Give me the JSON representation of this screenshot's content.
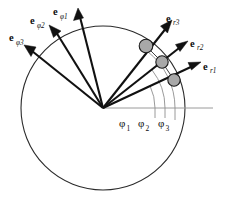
{
  "figure": {
    "background_color": "#ffffff",
    "width": 228,
    "height": 201,
    "circle": {
      "name": "reference-circle",
      "center_x": 103,
      "center_y": 108,
      "radius": 82,
      "stroke_color": "#2b2b2b"
    },
    "origin": {
      "x": 103,
      "y": 108
    },
    "axis": {
      "name": "polar-axis",
      "label": "",
      "from_x": 103,
      "from_y": 108,
      "to_x": 213,
      "to_y": 108,
      "color": "#9a9a9a"
    }
  },
  "angles": {
    "color": "#8f8f8f",
    "items": [
      {
        "id": "phi1",
        "symbol": "φ",
        "subscript": "1",
        "value_deg": 25,
        "arc_radius": 52,
        "label_x": 121,
        "label_y": 126
      },
      {
        "id": "phi2",
        "symbol": "φ",
        "subscript": "2",
        "value_deg": 38,
        "arc_radius": 62,
        "label_x": 140,
        "label_y": 126
      },
      {
        "id": "phi3",
        "symbol": "φ",
        "subscript": "3",
        "value_deg": 52,
        "arc_radius": 72,
        "label_x": 159,
        "label_y": 126
      }
    ]
  },
  "nodes": [
    {
      "id": "node1",
      "angle_deg": 25,
      "x": 174,
      "y": 80,
      "radius": 6.2,
      "fill": "#a8a8a8",
      "stroke": "#1a1a1a"
    },
    {
      "id": "node2",
      "angle_deg": 38,
      "x": 162,
      "y": 62,
      "radius": 6.2,
      "fill": "#a8a8a8",
      "stroke": "#1a1a1a"
    },
    {
      "id": "node3",
      "angle_deg": 52,
      "x": 146,
      "y": 46,
      "radius": 6.8,
      "fill": "#a8a8a8",
      "stroke": "#1a1a1a"
    }
  ],
  "vectors": {
    "color": "#111111",
    "radial": [
      {
        "id": "er1",
        "base_symbol": "e",
        "subscript": "r1",
        "from_x": 103,
        "from_y": 108,
        "to_x": 199,
        "to_y": 63,
        "label_x": 203,
        "label_y": 70,
        "label_sub_dx": 7.2,
        "label_sub_dy": 3.4
      },
      {
        "id": "er2",
        "base_symbol": "e",
        "subscript": "r2",
        "from_x": 103,
        "from_y": 108,
        "to_x": 186,
        "to_y": 43,
        "label_x": 189,
        "label_y": 48,
        "label_sub_dx": 7.2,
        "label_sub_dy": 3.4
      },
      {
        "id": "er3",
        "base_symbol": "e",
        "subscript": "r3",
        "from_x": 103,
        "from_y": 108,
        "to_x": 171,
        "to_y": 22,
        "label_x": 166,
        "label_y": 22,
        "label_sub_dx": 7.2,
        "label_sub_dy": 3.4
      }
    ],
    "tangential": [
      {
        "id": "ephi1",
        "base_symbol": "e",
        "subscript": "φ1",
        "from_x": 103,
        "from_y": 108,
        "to_x": 78,
        "to_y": 10,
        "label_x": 53,
        "label_y": 18,
        "label_sub_dx": 7.2,
        "label_sub_dy": 3.4
      },
      {
        "id": "ephi2",
        "base_symbol": "e",
        "subscript": "φ2",
        "from_x": 103,
        "from_y": 108,
        "to_x": 50,
        "to_y": 27,
        "label_x": 30,
        "label_y": 25,
        "label_sub_dx": 7.2,
        "label_sub_dy": 3.4
      },
      {
        "id": "ephi3",
        "base_symbol": "e",
        "subscript": "φ3",
        "from_x": 103,
        "from_y": 108,
        "to_x": 25,
        "to_y": 47,
        "label_x": 10,
        "label_y": 42,
        "label_sub_dx": 7.2,
        "label_sub_dy": 3.4
      }
    ]
  },
  "chords": [
    {
      "id": "chord-3-2",
      "x1": 146,
      "y1": 46,
      "x2": 162,
      "y2": 62
    },
    {
      "id": "chord-2-1",
      "x1": 162,
      "y1": 62,
      "x2": 174,
      "y2": 80
    }
  ]
}
